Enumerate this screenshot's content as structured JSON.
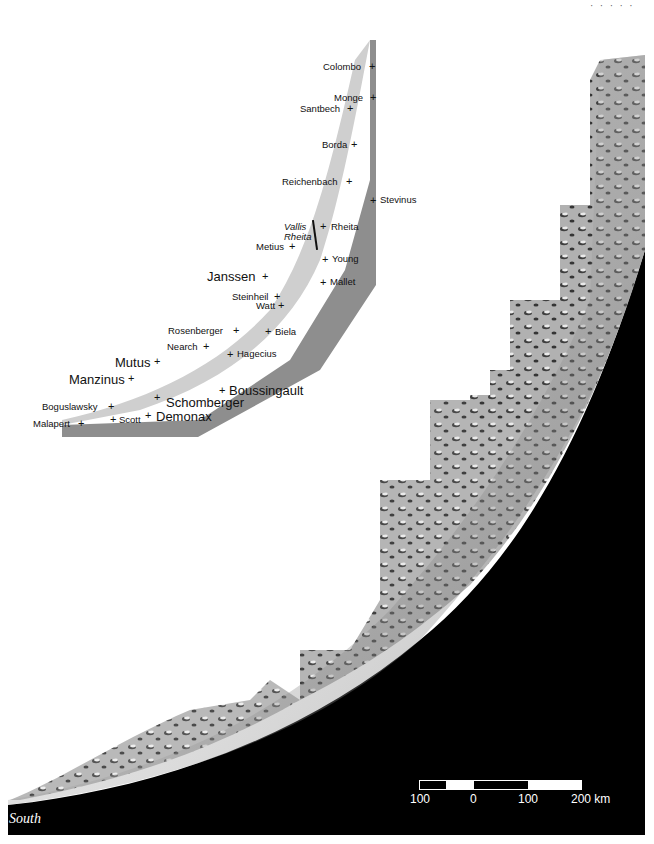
{
  "orientation_label": "South",
  "colors": {
    "background": "#ffffff",
    "space": "#000000",
    "key_band": "#8e8e8e",
    "label_text": "#111111"
  },
  "scale_bar": {
    "ticks": [
      "100",
      "0",
      "100",
      "200 km"
    ],
    "unit": "km"
  },
  "craters": [
    {
      "name": "Colombo",
      "style": "small"
    },
    {
      "name": "Monge",
      "style": "small"
    },
    {
      "name": "Santbech",
      "style": "small"
    },
    {
      "name": "Borda",
      "style": "small"
    },
    {
      "name": "Reichenbach",
      "style": "small"
    },
    {
      "name": "Stevinus",
      "style": "small"
    },
    {
      "name": "Rheita",
      "style": "small"
    },
    {
      "name": "Metius",
      "style": "small"
    },
    {
      "name": "Young",
      "style": "small"
    },
    {
      "name": "Janssen",
      "style": "large"
    },
    {
      "name": "Mallet",
      "style": "small"
    },
    {
      "name": "Steinheil",
      "style": "small"
    },
    {
      "name": "Watt",
      "style": "small"
    },
    {
      "name": "Rosenberger",
      "style": "small"
    },
    {
      "name": "Biela",
      "style": "small"
    },
    {
      "name": "Nearch",
      "style": "small"
    },
    {
      "name": "Hagecius",
      "style": "small"
    },
    {
      "name": "Mutus",
      "style": "large"
    },
    {
      "name": "Manzinus",
      "style": "large"
    },
    {
      "name": "Boussingault",
      "style": "large"
    },
    {
      "name": "Schomberger",
      "style": "small"
    },
    {
      "name": "Boguslawsky",
      "style": "large"
    },
    {
      "name": "Malapert",
      "style": "small"
    },
    {
      "name": "Scott",
      "style": "small"
    },
    {
      "name": "Demonax",
      "style": "large"
    }
  ],
  "features": [
    {
      "name": "Vallis Rheita",
      "line1": "Vallis",
      "line2": "Rheita",
      "style": "italic"
    }
  ]
}
